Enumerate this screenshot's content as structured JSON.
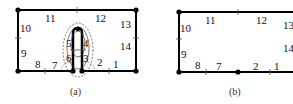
{
  "panels": [
    {
      "caption": "(a)",
      "edge_labels": [
        "1",
        "2",
        "3",
        "4",
        "5",
        "6",
        "7",
        "8",
        "9",
        "10",
        "11",
        "12",
        "13",
        "14"
      ]
    },
    {
      "caption": "(b)",
      "edge_labels": [
        "1",
        "2",
        "7",
        "8",
        "9",
        "10",
        "11",
        "12",
        "13",
        "14"
      ]
    }
  ]
}
